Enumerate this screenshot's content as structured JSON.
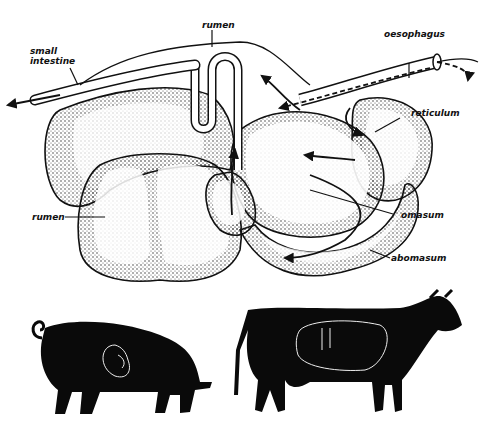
{
  "diagram": {
    "labels": {
      "rumen_top": "rumen",
      "small_intestine_line1": "small",
      "small_intestine_line2": "intestine",
      "oesophagus": "oesophagus",
      "reticulum": "reticulum",
      "rumen_left": "rumen",
      "omasum": "omasum",
      "abomasum": "abomasum"
    },
    "animals": [
      "pig",
      "cow"
    ],
    "colors": {
      "ink": "#111111",
      "background": "#ffffff",
      "stipple": "#222222",
      "silhouette": "#0a0a0a",
      "outline_in_silhouette": "#e8e8e8"
    }
  }
}
